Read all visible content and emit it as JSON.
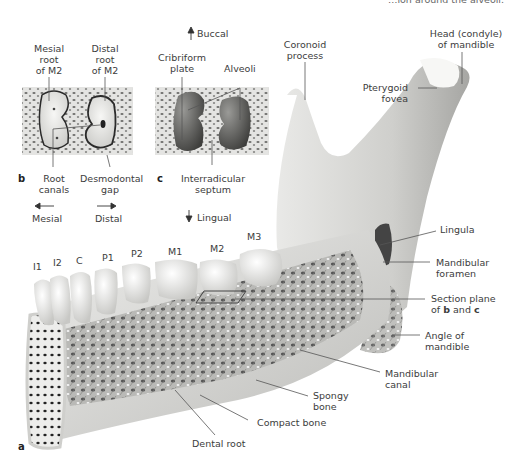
{
  "top_caption_fragment": "…ion around the alveoli.",
  "panel_b": {
    "letter": "b",
    "labels": {
      "mesial_root": [
        "Mesial",
        "root",
        "of M2"
      ],
      "distal_root": [
        "Distal",
        "root",
        "of M2"
      ],
      "root_canals": [
        "Root",
        "canals"
      ],
      "desmodontal_gap": [
        "Desmodontal",
        "gap"
      ]
    },
    "directions": {
      "mesial": "Mesial",
      "distal": "Distal"
    }
  },
  "panel_c": {
    "letter": "c",
    "labels": {
      "cribriform_plate": [
        "Cribriform",
        "plate"
      ],
      "alveoli": "Alveoli",
      "interradicular_septum": [
        "Interradicular",
        "septum"
      ]
    },
    "directions": {
      "buccal": "Buccal",
      "lingual": "Lingual"
    }
  },
  "panel_a": {
    "letter": "a",
    "teeth": [
      "I1",
      "I2",
      "C",
      "P1",
      "P2",
      "M1",
      "M2",
      "M3"
    ],
    "labels": {
      "coronoid_process": [
        "Coronoid",
        "process"
      ],
      "head_condyle": [
        "Head (condyle)",
        "of mandible"
      ],
      "pterygoid_fovea": [
        "Pterygoid",
        "fovea"
      ],
      "lingula": "Lingula",
      "mandibular_foramen": [
        "Mandibular",
        "foramen"
      ],
      "section_plane": [
        "Section plane",
        "of",
        "b",
        "and",
        "c"
      ],
      "angle_of_mandible": [
        "Angle of",
        "mandible"
      ],
      "mandibular_canal": [
        "Mandibular",
        "canal"
      ],
      "spongy_bone": [
        "Spongy",
        "bone"
      ],
      "compact_bone": "Compact bone",
      "dental_root": "Dental root"
    }
  },
  "colors": {
    "bone_light": "#e8e8e6",
    "bone_mid": "#c9c9c6",
    "bone_dark": "#8e8e8b",
    "tooth": "#f2f2f0",
    "leader": "#555555",
    "text": "#3c3c3c"
  }
}
